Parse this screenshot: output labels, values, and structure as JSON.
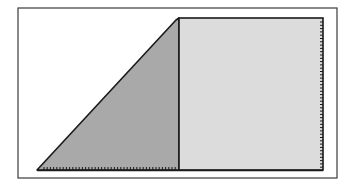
{
  "diagram": {
    "type": "geometric-figure",
    "canvas": {
      "width": 355,
      "height": 186,
      "background": "#ffffff"
    },
    "frame": {
      "x": 18,
      "y": 8,
      "width": 319,
      "height": 170,
      "stroke": "#3a3a3a",
      "stroke_width": 1.2
    },
    "triangle": {
      "points": [
        [
          37,
          170
        ],
        [
          176,
          20
        ],
        [
          179,
          18
        ],
        [
          179,
          170
        ]
      ],
      "fill": "#a9a9a9",
      "stroke": "#1a1a1a",
      "stroke_width": 1.6
    },
    "rectangle": {
      "x": 179,
      "y": 18,
      "width": 144,
      "height": 152,
      "fill": "#dcdcdc",
      "stroke": "#1a1a1a",
      "stroke_width": 1.6
    },
    "ticks": {
      "bottom": {
        "x_start": 44,
        "x_end": 178,
        "y": 170,
        "spacing": 3.2,
        "length": 3,
        "color": "#1a1a1a"
      },
      "right": {
        "y_start": 22,
        "y_end": 168,
        "x": 323,
        "spacing": 3.3,
        "length": 3,
        "color": "#1a1a1a"
      }
    }
  }
}
